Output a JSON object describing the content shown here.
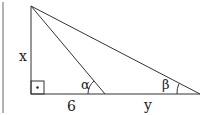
{
  "diagram": {
    "type": "right-triangle-geometry",
    "colors": {
      "stroke": "#333333",
      "background": "#ffffff"
    },
    "points": {
      "apex": [
        31,
        6
      ],
      "right_angle": [
        31,
        94
      ],
      "mid_base": [
        105,
        94
      ],
      "far_base": [
        200,
        94
      ]
    },
    "labels": {
      "vertical_side": "x",
      "base_left_segment": "6",
      "base_right_segment": "y",
      "angle_mid": "α",
      "angle_far": "β",
      "right_angle_marker": "·"
    }
  }
}
